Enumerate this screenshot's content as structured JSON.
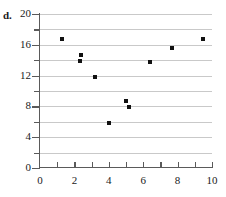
{
  "part_label": "d.",
  "chart_data": {
    "type": "scatter",
    "title": "",
    "xlabel": "",
    "ylabel": "",
    "xlim": [
      0,
      10
    ],
    "ylim": [
      0,
      20
    ],
    "grid": "horizontal",
    "legend": "none",
    "marker": "square",
    "marker_color": "#111111",
    "gridline_color": "#c9c9c9",
    "axis_color": "#5a5a5a",
    "x_ticks_major": [
      0,
      2,
      4,
      6,
      8,
      10
    ],
    "x_ticks_minor": [
      1,
      3,
      5,
      7,
      9
    ],
    "x_tick_labels": [
      "0",
      "2",
      "4",
      "6",
      "8",
      "10"
    ],
    "y_ticks_major": [
      0,
      4,
      8,
      12,
      16,
      20
    ],
    "y_ticks_minor": [
      2,
      6,
      10,
      14,
      18
    ],
    "y_tick_labels": [
      "0",
      "4",
      "8",
      "12",
      "16",
      "20"
    ],
    "gridline_values": [
      2,
      4,
      6,
      8,
      10,
      12,
      14,
      16,
      18,
      20
    ],
    "points": [
      {
        "x": 1.3,
        "y": 16.7
      },
      {
        "x": 2.4,
        "y": 14.7
      },
      {
        "x": 2.3,
        "y": 13.9
      },
      {
        "x": 3.2,
        "y": 11.8
      },
      {
        "x": 4.0,
        "y": 5.8
      },
      {
        "x": 5.0,
        "y": 8.7
      },
      {
        "x": 5.2,
        "y": 7.9
      },
      {
        "x": 6.4,
        "y": 13.8
      },
      {
        "x": 7.7,
        "y": 15.6
      },
      {
        "x": 9.5,
        "y": 16.7
      }
    ]
  }
}
